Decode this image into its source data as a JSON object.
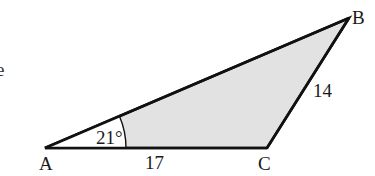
{
  "diagram": {
    "type": "triangle",
    "fill_color": "#e2e2e2",
    "stroke_color": "#111111",
    "vertices": {
      "A": {
        "label": "A",
        "x": 45,
        "y": 148
      },
      "B": {
        "label": "B",
        "x": 349,
        "y": 18
      },
      "C": {
        "label": "C",
        "x": 267,
        "y": 148
      }
    },
    "sides": {
      "AC": {
        "label": "17"
      },
      "CB": {
        "label": "14"
      }
    },
    "angles": {
      "A": {
        "label": "21°"
      }
    },
    "cropped_text_fragment": "e"
  }
}
